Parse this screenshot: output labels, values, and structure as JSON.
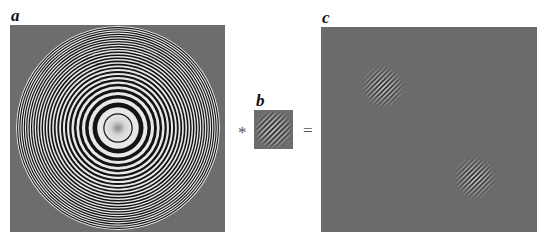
{
  "figure": {
    "panels": [
      {
        "id": "a",
        "label": "a",
        "description": "Concentric ring pattern (chirp / zone plate) on gray background"
      },
      {
        "id": "b",
        "label": "b",
        "description": "Small oriented grating kernel (diagonal stripes)"
      },
      {
        "id": "c",
        "label": "c",
        "description": "Result: gray field with two localized diagonal grating blobs"
      }
    ],
    "operators": {
      "convolve": "*",
      "equals": "="
    },
    "colors": {
      "background": "#6d6d6d",
      "light": "#e8e8e8",
      "dark": "#141414"
    }
  }
}
